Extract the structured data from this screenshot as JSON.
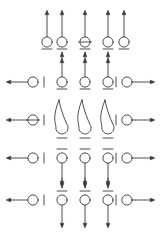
{
  "figure": {
    "canvas": {
      "width": 160,
      "height": 233
    },
    "style": {
      "background_color": "#ffffff",
      "stroke_color": "#3a3a3a",
      "stroke_width": 0.9,
      "circle_fill": "#ffffff",
      "circle_radius": 5.1,
      "bar_half_length": 5.0,
      "arrow_head_size": 3.2
    },
    "columns": {
      "label": "Vertical symbol columns (x pixel centers)",
      "x": [
        47,
        62,
        85,
        108,
        124
      ]
    },
    "rows": {
      "label": "Horizontal symbol rows (y pixel centers of circles)",
      "y": [
        42,
        82,
        120,
        158,
        200
      ]
    },
    "side_rails": {
      "label": "Horizontal arrow rails",
      "left_arrow_tip_x": 6,
      "right_arrow_tip_x": 155,
      "left_circle_x": 33,
      "right_circle_x": 127,
      "left_bar_x": 44,
      "right_bar_x": 116,
      "rows_y": [
        82,
        120,
        158,
        200
      ]
    },
    "elements": [
      {
        "id": "row1",
        "name": "top-row",
        "kind": "vertical-lollipops",
        "circle_y": 42,
        "stem_direction": "up",
        "stem_top_y": 10,
        "bar_side": "below",
        "bar_y": 49,
        "items": [
          {
            "col_x": 47,
            "marker": "plain",
            "stem": true,
            "arrow": "up",
            "below_arrow": false
          },
          {
            "col_x": 62,
            "marker": "plain",
            "stem": true,
            "arrow": "up",
            "below_arrow": true
          },
          {
            "col_x": 85,
            "marker": "crossed",
            "stem": true,
            "arrow": "up",
            "below_arrow": true
          },
          {
            "col_x": 108,
            "marker": "plain",
            "stem": true,
            "arrow": "up",
            "below_arrow": true
          },
          {
            "col_x": 124,
            "marker": "plain",
            "stem": true,
            "arrow": "up",
            "below_arrow": false
          }
        ]
      },
      {
        "id": "row2",
        "name": "second-row",
        "kind": "vertical-lollipops",
        "circle_y": 82,
        "stem_direction": "up",
        "stem_top_y": 58,
        "bar_side": "below",
        "bar_y": 89,
        "items": [
          {
            "col_x": 62,
            "marker": "plain",
            "stem": true,
            "arrow": "up",
            "below_arrow": false
          },
          {
            "col_x": 85,
            "marker": "plain",
            "stem": true,
            "arrow": "up",
            "below_arrow": false
          },
          {
            "col_x": 108,
            "marker": "plain",
            "stem": true,
            "arrow": "up",
            "below_arrow": false
          }
        ],
        "left_rail": {
          "marker": "plain",
          "arrow": "left"
        },
        "right_rail": {
          "marker": "plain",
          "arrow": "right"
        }
      },
      {
        "id": "row3",
        "name": "teardrop-row",
        "kind": "teardrop-loops",
        "circle_y": 128,
        "loop_apex_y": 100,
        "bar_side": "below",
        "bar_y": 138,
        "items": [
          {
            "col_x": 62,
            "marker": "teardrop"
          },
          {
            "col_x": 85,
            "marker": "teardrop"
          },
          {
            "col_x": 108,
            "marker": "teardrop"
          }
        ],
        "left_rail": {
          "marker": "crossed",
          "arrow": "left"
        },
        "right_rail": {
          "marker": "plain",
          "arrow": "right"
        }
      },
      {
        "id": "row4",
        "name": "fourth-row",
        "kind": "vertical-lollipops",
        "circle_y": 158,
        "stem_direction": "down",
        "stem_bottom_y": 186,
        "bar_side": "above",
        "bar_y": 149,
        "items": [
          {
            "col_x": 62,
            "marker": "plain",
            "stem": true,
            "arrow": "down",
            "above_arrow": false
          },
          {
            "col_x": 85,
            "marker": "plain",
            "stem": true,
            "arrow": "down",
            "above_arrow": false
          },
          {
            "col_x": 108,
            "marker": "plain",
            "stem": true,
            "arrow": "down",
            "above_arrow": false
          }
        ],
        "left_rail": {
          "marker": "plain",
          "arrow": "left"
        },
        "right_rail": {
          "marker": "plain",
          "arrow": "right"
        }
      },
      {
        "id": "row5",
        "name": "bottom-row",
        "kind": "vertical-lollipops-double",
        "circle_y": 200,
        "stem_direction": "down",
        "stem_bottom_y": 228,
        "bar_side": "above",
        "bar_y": 191,
        "incoming_arrow_top_y": 178,
        "items": [
          {
            "col_x": 62,
            "marker": "plain",
            "stem": true,
            "arrow": "down",
            "above_arrow": true
          },
          {
            "col_x": 85,
            "marker": "plain",
            "stem": true,
            "arrow": "down",
            "above_arrow": true
          },
          {
            "col_x": 108,
            "marker": "plain",
            "stem": true,
            "arrow": "down",
            "above_arrow": true
          }
        ],
        "left_rail": {
          "marker": "plain",
          "arrow": "left"
        },
        "right_rail": {
          "marker": "plain",
          "arrow": "right"
        }
      }
    ]
  }
}
